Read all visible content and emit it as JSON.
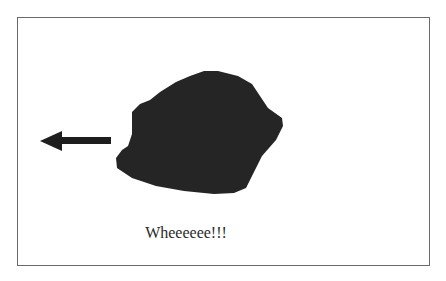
{
  "caption": "Wheeeeee!!!",
  "colors": {
    "blob": "#252525",
    "arrow": "#1e1e1e",
    "border": "#6a6a6a"
  },
  "icons": {
    "arrow": "left-arrow-icon",
    "shape": "blob-shape"
  }
}
